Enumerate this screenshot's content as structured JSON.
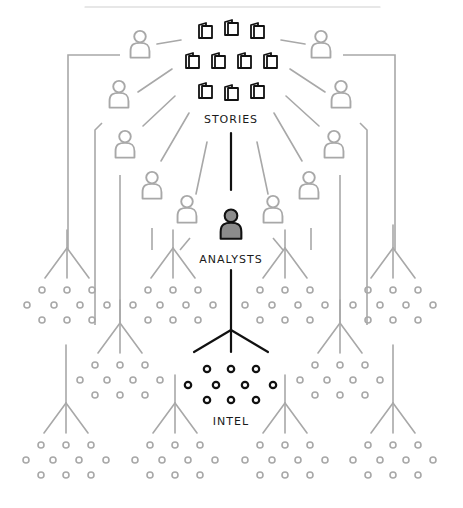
{
  "diagram": {
    "colors": {
      "primary": "#111111",
      "secondary": "#a8a8a8",
      "analyst_fill": "#8c8c8c",
      "background": "#ffffff"
    },
    "labels": {
      "stories": "STORIES",
      "analysts": "ANALYSTS",
      "intel": "INTEL"
    },
    "top_rule": {
      "x1": 85,
      "x2": 380,
      "y": 7
    },
    "stories": {
      "label_pos": [
        231,
        113
      ],
      "books": [
        [
          205,
          30
        ],
        [
          231,
          27
        ],
        [
          257,
          30
        ],
        [
          192,
          60
        ],
        [
          218,
          60
        ],
        [
          244,
          60
        ],
        [
          270,
          60
        ],
        [
          205,
          90
        ],
        [
          231,
          92
        ],
        [
          257,
          90
        ]
      ]
    },
    "analyst": {
      "pos": [
        231,
        225
      ],
      "label_pos": [
        231,
        253
      ]
    },
    "intel": {
      "label_pos": [
        231,
        415
      ],
      "fork": {
        "top": 320,
        "apex": 330,
        "bottom": 352,
        "spread": 37
      },
      "dots": [
        [
          207,
          369
        ],
        [
          231,
          369
        ],
        [
          256,
          369
        ],
        [
          188,
          385
        ],
        [
          216,
          385
        ],
        [
          245,
          385
        ],
        [
          273,
          385
        ],
        [
          207,
          400
        ],
        [
          231,
          400
        ],
        [
          256,
          400
        ]
      ]
    },
    "other_analysts": [
      {
        "side": "left",
        "pos": [
          140,
          45
        ]
      },
      {
        "side": "left",
        "pos": [
          119,
          95
        ]
      },
      {
        "side": "left",
        "pos": [
          125,
          145
        ]
      },
      {
        "side": "left",
        "pos": [
          152,
          186
        ]
      },
      {
        "side": "left",
        "pos": [
          187,
          210
        ]
      },
      {
        "side": "right",
        "pos": [
          321,
          45
        ]
      },
      {
        "side": "right",
        "pos": [
          341,
          95
        ]
      },
      {
        "side": "right",
        "pos": [
          334,
          145
        ]
      },
      {
        "side": "right",
        "pos": [
          309,
          186
        ]
      },
      {
        "side": "right",
        "pos": [
          273,
          210
        ]
      }
    ],
    "story_links_grey": [
      [
        157,
        44,
        181,
        40
      ],
      [
        138,
        92,
        172,
        69
      ],
      [
        143,
        126,
        175,
        96
      ],
      [
        161,
        161,
        189,
        113
      ],
      [
        196,
        194,
        207,
        142
      ],
      [
        281,
        40,
        305,
        44
      ],
      [
        290,
        69,
        325,
        92
      ],
      [
        286,
        96,
        319,
        126
      ],
      [
        274,
        113,
        302,
        161
      ],
      [
        257,
        142,
        268,
        194
      ]
    ],
    "feed_paths_grey": [
      [
        [
          120,
          55
        ],
        [
          68,
          55
        ],
        [
          68,
          250
        ]
      ],
      [
        [
          102,
          123
        ],
        [
          95,
          130
        ],
        [
          95,
          325
        ]
      ],
      [
        [
          120,
          175
        ],
        [
          120,
          325
        ]
      ],
      [
        [
          152,
          228
        ],
        [
          152,
          250
        ]
      ],
      [
        [
          190,
          238
        ],
        [
          180,
          250
        ]
      ],
      [
        [
          60,
          0
        ],
        [
          60,
          0
        ]
      ],
      [
        [
          343,
          55
        ],
        [
          395,
          55
        ],
        [
          395,
          250
        ]
      ],
      [
        [
          360,
          123
        ],
        [
          367,
          130
        ],
        [
          367,
          325
        ]
      ],
      [
        [
          340,
          175
        ],
        [
          340,
          325
        ]
      ],
      [
        [
          311,
          228
        ],
        [
          311,
          250
        ]
      ],
      [
        [
          273,
          238
        ],
        [
          283,
          250
        ]
      ]
    ],
    "clusters_grey": [
      {
        "fork_top": [
          67,
          230
        ],
        "dots_center": [
          67,
          305
        ]
      },
      {
        "fork_top": [
          173,
          230
        ],
        "dots_center": [
          173,
          305
        ]
      },
      {
        "fork_top": [
          285,
          230
        ],
        "dots_center": [
          285,
          305
        ]
      },
      {
        "fork_top": [
          393,
          225
        ],
        "dots_center": [
          393,
          305
        ]
      },
      {
        "fork_top": [
          120,
          300
        ],
        "dots_center": [
          120,
          380
        ]
      },
      {
        "fork_top": [
          340,
          300
        ],
        "dots_center": [
          340,
          380
        ]
      },
      {
        "fork_top": [
          66,
          345
        ],
        "dots_center": [
          66,
          460
        ]
      },
      {
        "fork_top": [
          175,
          375
        ],
        "dots_center": [
          175,
          460
        ]
      },
      {
        "fork_top": [
          285,
          375
        ],
        "dots_center": [
          285,
          460
        ]
      },
      {
        "fork_top": [
          393,
          345
        ],
        "dots_center": [
          393,
          460
        ]
      }
    ]
  }
}
